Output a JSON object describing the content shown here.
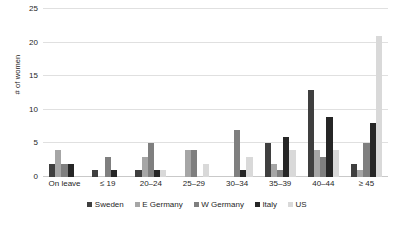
{
  "chart_data": {
    "type": "bar",
    "title": "",
    "xlabel": "",
    "ylabel": "# of women",
    "ylim": [
      0,
      25
    ],
    "yticks": [
      0,
      5,
      10,
      15,
      20,
      25
    ],
    "grid": true,
    "legend_position": "bottom",
    "categories": [
      "On leave",
      "≤ 19",
      "20–24",
      "25–29",
      "30–34",
      "35–39",
      "40–44",
      "≥ 45"
    ],
    "series": [
      {
        "name": "Sweden",
        "color": "#3f3f3f",
        "values": [
          2,
          1,
          1,
          0,
          0,
          5,
          13,
          2
        ]
      },
      {
        "name": "E Germany",
        "color": "#a6a6a6",
        "values": [
          4,
          0,
          3,
          4,
          0,
          2,
          4,
          1
        ]
      },
      {
        "name": "W Germany",
        "color": "#7f7f7f",
        "values": [
          2,
          3,
          5,
          4,
          7,
          1,
          3,
          5
        ]
      },
      {
        "name": "Italy",
        "color": "#262626",
        "values": [
          2,
          1,
          1,
          0,
          1,
          6,
          9,
          8
        ]
      },
      {
        "name": "US",
        "color": "#d9d9d9",
        "values": [
          0,
          0,
          1,
          2,
          3,
          4,
          4,
          21
        ]
      }
    ]
  }
}
